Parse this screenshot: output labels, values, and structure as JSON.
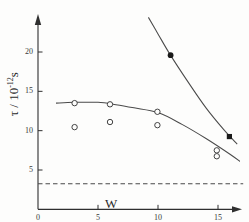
{
  "chart_data": {
    "type": "scatter",
    "title": "",
    "xlabel": "W",
    "ylabel_tau": "τ",
    "ylabel_sep": " / 10",
    "ylabel_exp": "-12",
    "ylabel_unit": "s",
    "xlim": [
      0,
      17.2
    ],
    "ylim": [
      0,
      23.5
    ],
    "xticks": [
      0,
      5,
      10,
      15
    ],
    "xtick_labels": [
      "0",
      "5",
      "10",
      "15"
    ],
    "yticks": [
      5,
      10,
      15,
      20
    ],
    "ytick_labels": [
      "5",
      "10",
      "15",
      "20"
    ],
    "grid": false,
    "legend": "none",
    "axis_arrows": true,
    "series": [
      {
        "name": "upper-filled-series",
        "marker": "filled",
        "points": [
          {
            "x": 11.05,
            "y": 19.6,
            "marker": "circle"
          },
          {
            "x": 15.95,
            "y": 9.25,
            "marker": "square"
          }
        ]
      },
      {
        "name": "lower-open-series",
        "marker": "open-circle",
        "points": [
          {
            "x": 3.05,
            "y": 13.5
          },
          {
            "x": 3.05,
            "y": 10.45
          },
          {
            "x": 6.0,
            "y": 13.35
          },
          {
            "x": 6.0,
            "y": 11.1
          },
          {
            "x": 9.95,
            "y": 12.4
          },
          {
            "x": 9.95,
            "y": 10.7
          },
          {
            "x": 14.9,
            "y": 7.5
          },
          {
            "x": 14.9,
            "y": 6.75
          }
        ]
      }
    ],
    "curves": [
      {
        "name": "upper-steep-curve",
        "style": "solid",
        "path_points": [
          {
            "x": 9.2,
            "y": 24.4
          },
          {
            "x": 10.0,
            "y": 22.3
          },
          {
            "x": 11.0,
            "y": 19.7
          },
          {
            "x": 12.5,
            "y": 16.2
          },
          {
            "x": 14.0,
            "y": 12.9
          },
          {
            "x": 15.5,
            "y": 10.1
          },
          {
            "x": 16.6,
            "y": 8.3
          }
        ]
      },
      {
        "name": "lower-flat-curve",
        "style": "solid",
        "path_points": [
          {
            "x": 1.5,
            "y": 13.5
          },
          {
            "x": 3.0,
            "y": 13.6
          },
          {
            "x": 5.0,
            "y": 13.6
          },
          {
            "x": 6.5,
            "y": 13.3
          },
          {
            "x": 8.0,
            "y": 12.9
          },
          {
            "x": 10.0,
            "y": 12.3
          },
          {
            "x": 12.0,
            "y": 10.8
          },
          {
            "x": 14.0,
            "y": 9.0
          },
          {
            "x": 16.0,
            "y": 7.0
          },
          {
            "x": 17.0,
            "y": 5.9
          }
        ]
      }
    ],
    "reference_line": {
      "name": "dashed-baseline",
      "style": "dashed",
      "y": 3.25,
      "x_start": 0.0,
      "x_end": 17.1
    }
  }
}
